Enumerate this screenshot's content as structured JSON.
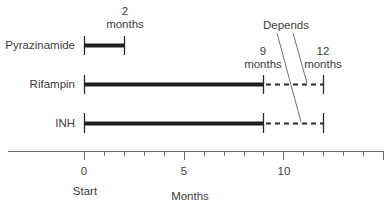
{
  "diagram": {
    "type": "treatment-timeline",
    "axis": {
      "label": "Months",
      "start_label": "Start",
      "tick_labels": [
        "0",
        "5",
        "10"
      ],
      "range": [
        0,
        15
      ],
      "minor_tick_step": 1
    },
    "drugs": [
      {
        "name": "Pyrazinamide",
        "solid_months": 2,
        "dashed_until_months": null
      },
      {
        "name": "Rifampin",
        "solid_months": 9,
        "dashed_until_months": 12
      },
      {
        "name": "INH",
        "solid_months": 9,
        "dashed_until_months": 12
      }
    ],
    "annotations": {
      "two_months_num": "2",
      "two_months_unit": "months",
      "nine_months_num": "9",
      "nine_months_unit": "months",
      "twelve_months_num": "12",
      "twelve_months_unit": "months",
      "depends": "Depends"
    },
    "colors": {
      "bar": "#1e1e1e",
      "axis": "#6e6e6e",
      "text": "#3d3d3d"
    }
  }
}
